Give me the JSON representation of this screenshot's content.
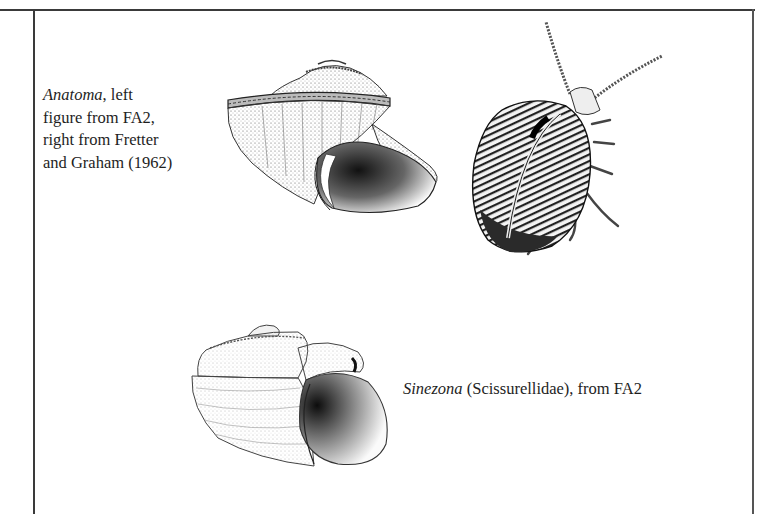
{
  "figures": [
    {
      "id": "anatoma",
      "caption": {
        "taxon": "Anatoma",
        "lines": [
          ", left",
          "figure from FA2,",
          "right from Fretter",
          "and Graham (1962)"
        ]
      },
      "illustrations": [
        "anatoma-shell-drawing",
        "anatoma-animal-drawing"
      ]
    },
    {
      "id": "sinezona",
      "caption": {
        "taxon": "Sinezona",
        "rest": " (Scissurellidae), from FA2"
      },
      "illustrations": [
        "sinezona-shell-drawing"
      ]
    }
  ],
  "colors": {
    "rule": "#3a3a3a",
    "ink": "#1e1e1e",
    "background": "#ffffff"
  }
}
